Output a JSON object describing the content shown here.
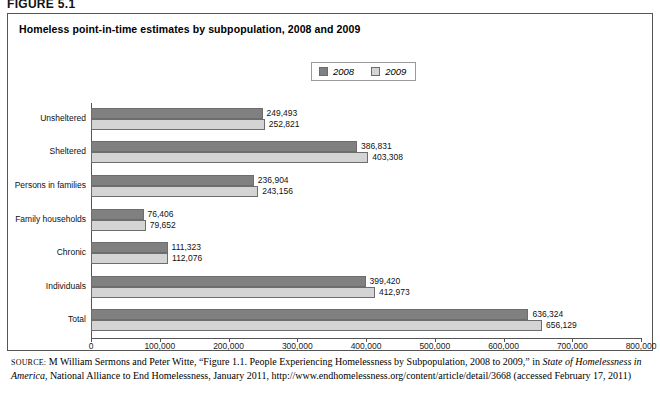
{
  "figure_label": "FIGURE 5.1",
  "chart_title": "Homeless point-in-time estimates by subpopulation, 2008 and 2009",
  "legend": {
    "items": [
      {
        "label": "2008",
        "color": "#808080"
      },
      {
        "label": "2009",
        "color": "#d4d4d4"
      }
    ]
  },
  "source": {
    "prefix": "SOURCE:",
    "part1": " M William Sermons and Peter Witte, “Figure 1.1. People Experiencing Homelessness by Subpopulation, 2008 to 2009,” in ",
    "italic1": "State of Homelessness in America",
    "part2": ", National Alliance to End Homelessness, January 2011, http://www.endhomelessness.org/content/article/detail/3668 (accessed February 17, 2011)"
  },
  "chart_data": {
    "type": "bar",
    "orientation": "horizontal",
    "title": "Homeless point-in-time estimates by subpopulation, 2008 and 2009",
    "xlabel": "",
    "ylabel": "",
    "xlim": [
      0,
      800000
    ],
    "xticks": [
      0,
      100000,
      200000,
      300000,
      400000,
      500000,
      600000,
      700000,
      800000
    ],
    "xtick_labels": [
      "0",
      "100,000",
      "200,000",
      "300,000",
      "400,000",
      "500,000",
      "600,000",
      "700,000",
      "800,000"
    ],
    "grid": false,
    "legend_position": "top-center",
    "categories": [
      "Unsheltered",
      "Sheltered",
      "Persons in families",
      "Family households",
      "Chronic",
      "Individuals",
      "Total"
    ],
    "series": [
      {
        "name": "2008",
        "color": "#808080",
        "values": [
          249493,
          386831,
          236904,
          76406,
          111323,
          399420,
          636324
        ],
        "labels": [
          "249,493",
          "386,831",
          "236,904",
          "76,406",
          "111,323",
          "399,420",
          "636,324"
        ]
      },
      {
        "name": "2009",
        "color": "#d4d4d4",
        "values": [
          252821,
          403308,
          243156,
          79652,
          112076,
          412973,
          656129
        ],
        "labels": [
          "252,821",
          "403,308",
          "243,156",
          "79,652",
          "112,076",
          "412,973",
          "656,129"
        ]
      }
    ]
  }
}
